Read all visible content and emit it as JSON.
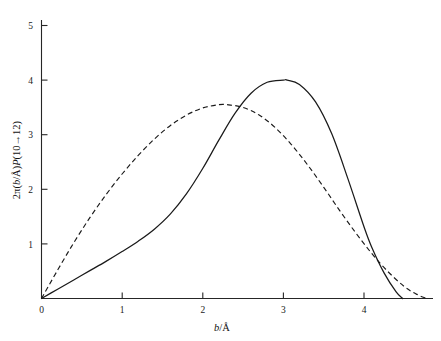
{
  "figure": {
    "background_color": "#ffffff",
    "line_color": "#1a1a1a"
  },
  "chart_data": {
    "type": "line",
    "title": "",
    "subtitle": "",
    "xlabel": "b/Å",
    "xlabel_parts": {
      "variable": "b",
      "slash": "/",
      "unit": "Å"
    },
    "ylabel": "2π(b/Å)P(10→12)",
    "ylabel_parts": {
      "prefix": "2π(",
      "variable": "b",
      "slash": "/",
      "unit": "Å",
      "middle": ")",
      "p": "P",
      "transition": "(10→12)"
    },
    "xlim": [
      0,
      4.8
    ],
    "ylim": [
      0,
      5.3
    ],
    "xticks": [
      0,
      1,
      2,
      3,
      4
    ],
    "yticks": [
      1,
      2,
      3,
      4,
      5
    ],
    "xticklabels": [
      "0",
      "1",
      "2",
      "3",
      "4"
    ],
    "yticklabels": [
      "1",
      "2",
      "3",
      "4",
      "5"
    ],
    "grid": false,
    "legend": "none",
    "axis_style": "left-and-bottom-spines",
    "series": [
      {
        "name": "solid-curve",
        "style": "solid",
        "color": "#1a1a1a",
        "peak_x": 3.05,
        "peak_y": 4.0,
        "x": [
          0.0,
          0.2,
          0.4,
          0.6,
          0.8,
          1.0,
          1.2,
          1.4,
          1.6,
          1.8,
          2.0,
          2.2,
          2.4,
          2.6,
          2.8,
          3.0,
          3.05,
          3.2,
          3.4,
          3.6,
          3.8,
          4.0,
          4.1,
          4.25,
          4.4,
          4.48
        ],
        "y": [
          0.0,
          0.17,
          0.34,
          0.51,
          0.68,
          0.86,
          1.05,
          1.27,
          1.55,
          1.92,
          2.38,
          2.9,
          3.39,
          3.76,
          3.96,
          4.0,
          4.0,
          3.92,
          3.6,
          3.02,
          2.2,
          1.32,
          0.93,
          0.47,
          0.12,
          0.0
        ]
      },
      {
        "name": "dashed-curve",
        "style": "dashed",
        "color": "#1a1a1a",
        "peak_x": 2.3,
        "peak_y": 3.55,
        "x": [
          0.0,
          0.2,
          0.4,
          0.6,
          0.8,
          1.0,
          1.2,
          1.4,
          1.6,
          1.8,
          2.0,
          2.2,
          2.3,
          2.5,
          2.7,
          2.9,
          3.1,
          3.3,
          3.5,
          3.7,
          3.9,
          4.1,
          4.3,
          4.5,
          4.65,
          4.78
        ],
        "y": [
          0.0,
          0.52,
          1.02,
          1.48,
          1.9,
          2.28,
          2.62,
          2.92,
          3.17,
          3.36,
          3.49,
          3.55,
          3.55,
          3.5,
          3.36,
          3.13,
          2.82,
          2.45,
          2.04,
          1.61,
          1.2,
          0.82,
          0.49,
          0.22,
          0.08,
          0.0
        ]
      }
    ],
    "annotations": [],
    "crossings": [
      {
        "x": 2.26,
        "y": 3.55,
        "description": "curves cross near dashed peak"
      },
      {
        "x": 4.15,
        "y": 0.66,
        "description": "curves cross on descending tail"
      }
    ]
  }
}
